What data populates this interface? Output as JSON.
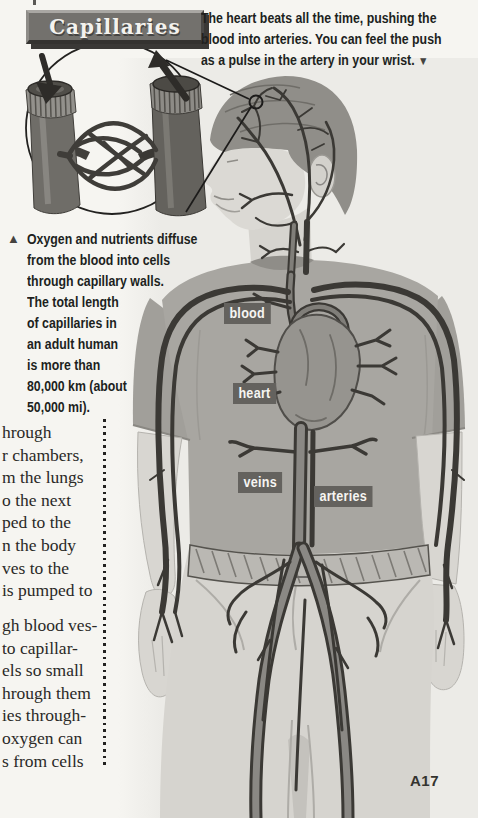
{
  "page": {
    "page_number": "A17",
    "background": "#f6f5f1"
  },
  "banner": {
    "label": "Capillaries"
  },
  "top_caption": {
    "lines": [
      "The heart beats all the time, pushing the",
      "blood into arteries. You can feel the push",
      "as a pulse in the artery in your wrist."
    ],
    "pointer_icon": "▼"
  },
  "capillary_caption": {
    "pointer_icon": "▲",
    "lines": [
      "Oxygen and nutrients diffuse",
      "from the blood into cells",
      "through capillary walls.",
      "The total length",
      "of capillaries in",
      "an adult human",
      "is more than",
      "80,000 km (about",
      "50,000 mi)."
    ]
  },
  "body_text": {
    "paragraph1_lines": [
      "hrough",
      "r chambers,",
      "m the lungs",
      "o the next",
      "ped to the",
      "n the body",
      "ves to the",
      "is pumped to"
    ],
    "paragraph2_lines": [
      "gh blood ves-",
      "to capillar-",
      "els so small",
      "hrough them",
      "ies through-",
      "oxygen can",
      "s from cells"
    ]
  },
  "figure_labels": {
    "blood": "blood",
    "heart": "heart",
    "veins": "veins",
    "arteries": "arteries"
  },
  "colors": {
    "label_bg": "#64625e",
    "banner_bg": "#73716d",
    "ink": "#201f1d",
    "vessel_dark": "#3b3935",
    "shirt": "#a8a6a1",
    "jeans": "#d6d4cf",
    "skin": "#dbd9d4"
  }
}
